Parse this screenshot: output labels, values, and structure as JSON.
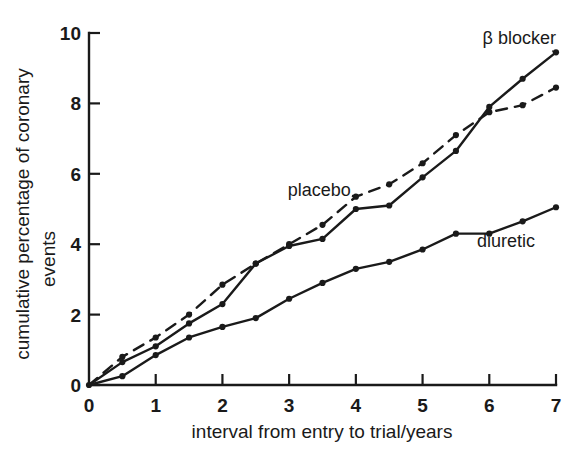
{
  "chart_data": {
    "type": "line",
    "title": "",
    "subtitle": "",
    "xlabel": "interval from entry to trial/years",
    "ylabel": "cumulative percentage of coronary events",
    "xlim": [
      0,
      7
    ],
    "ylim": [
      0,
      10
    ],
    "xticks": [
      0,
      1,
      2,
      3,
      4,
      5,
      6,
      7
    ],
    "xtick_labels": [
      "0",
      "1",
      "2",
      "3",
      "4",
      "5",
      "6",
      "7"
    ],
    "yticks": [
      0,
      2,
      4,
      6,
      8,
      10
    ],
    "ytick_labels": [
      "0",
      "2",
      "4",
      "6",
      "8",
      "10"
    ],
    "grid": false,
    "legend_position": "inline-annotations",
    "x": [
      0,
      0.5,
      1,
      1.5,
      2,
      2.5,
      3,
      3.5,
      4,
      4.5,
      5,
      5.5,
      6,
      6.5,
      7
    ],
    "series": [
      {
        "name": "β blocker",
        "style": "solid",
        "marker": "filled-circle",
        "color": "#1a1a1a",
        "values": [
          0,
          0.65,
          1.1,
          1.75,
          2.3,
          3.45,
          3.95,
          4.15,
          5.0,
          5.1,
          5.9,
          6.65,
          7.9,
          8.7,
          9.45
        ]
      },
      {
        "name": "placebo",
        "style": "dashed",
        "marker": "filled-circle",
        "color": "#1a1a1a",
        "values": [
          0,
          0.8,
          1.35,
          2.0,
          2.85,
          3.45,
          4.0,
          4.55,
          5.35,
          5.7,
          6.3,
          7.1,
          7.75,
          7.95,
          8.45
        ]
      },
      {
        "name": "diuretic",
        "style": "solid",
        "marker": "filled-circle",
        "color": "#1a1a1a",
        "values": [
          0,
          0.25,
          0.85,
          1.35,
          1.65,
          1.9,
          2.45,
          2.9,
          3.3,
          3.5,
          3.85,
          4.3,
          4.3,
          4.65,
          5.05
        ]
      }
    ],
    "annotations": [
      {
        "text": "β blocker",
        "x": 6.45,
        "y": 9.85,
        "anchor": "middle",
        "leader_to": {
          "x": 7.0,
          "y": 9.45
        }
      },
      {
        "text": "placebo",
        "x": 3.45,
        "y": 5.55,
        "anchor": "middle",
        "leader_to": {
          "x": 4.0,
          "y": 5.35
        }
      },
      {
        "text": "diuretic",
        "x": 6.25,
        "y": 4.1,
        "anchor": "middle",
        "leader_to": null
      }
    ]
  },
  "axis": {
    "x_title": "interval from entry to trial/years",
    "y_title_line1": "cumulative percentage of coronary",
    "y_title_line2": "events"
  }
}
